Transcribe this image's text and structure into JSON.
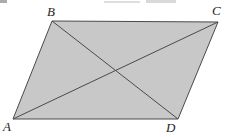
{
  "figure": {
    "type": "geometry-diagram",
    "shape": "parallelogram",
    "caption": "",
    "background_color": "#ffffff",
    "fill_color": "#c8c8c8",
    "stroke_color": "#4a4a4a",
    "stroke_width": 1,
    "width": 230,
    "height": 137,
    "vertices": [
      {
        "id": "A",
        "label": "A",
        "x": 13,
        "y": 119,
        "label_x": 3,
        "label_y": 120
      },
      {
        "id": "B",
        "label": "B",
        "x": 52,
        "y": 21,
        "label_x": 47,
        "label_y": 5
      },
      {
        "id": "C",
        "label": "C",
        "x": 218,
        "y": 22,
        "label_x": 212,
        "label_y": 4
      },
      {
        "id": "D",
        "label": "D",
        "x": 178,
        "y": 119,
        "label_x": 166,
        "label_y": 121
      }
    ],
    "sides": [
      {
        "name": "AB",
        "from": "A",
        "to": "B"
      },
      {
        "name": "BC",
        "from": "B",
        "to": "C"
      },
      {
        "name": "CD",
        "from": "C",
        "to": "D"
      },
      {
        "name": "DA",
        "from": "D",
        "to": "A"
      }
    ],
    "diagonals": [
      {
        "name": "AC",
        "from": "A",
        "to": "C"
      },
      {
        "name": "BD",
        "from": "B",
        "to": "D"
      }
    ],
    "diagonal_intersection": {
      "x": 115,
      "y": 72
    },
    "artifacts": [
      {
        "id": "artifact-left",
        "kind": "scan-speck"
      },
      {
        "id": "artifact-mid",
        "kind": "scan-streak"
      },
      {
        "id": "artifact-right",
        "kind": "scan-streak"
      }
    ]
  }
}
